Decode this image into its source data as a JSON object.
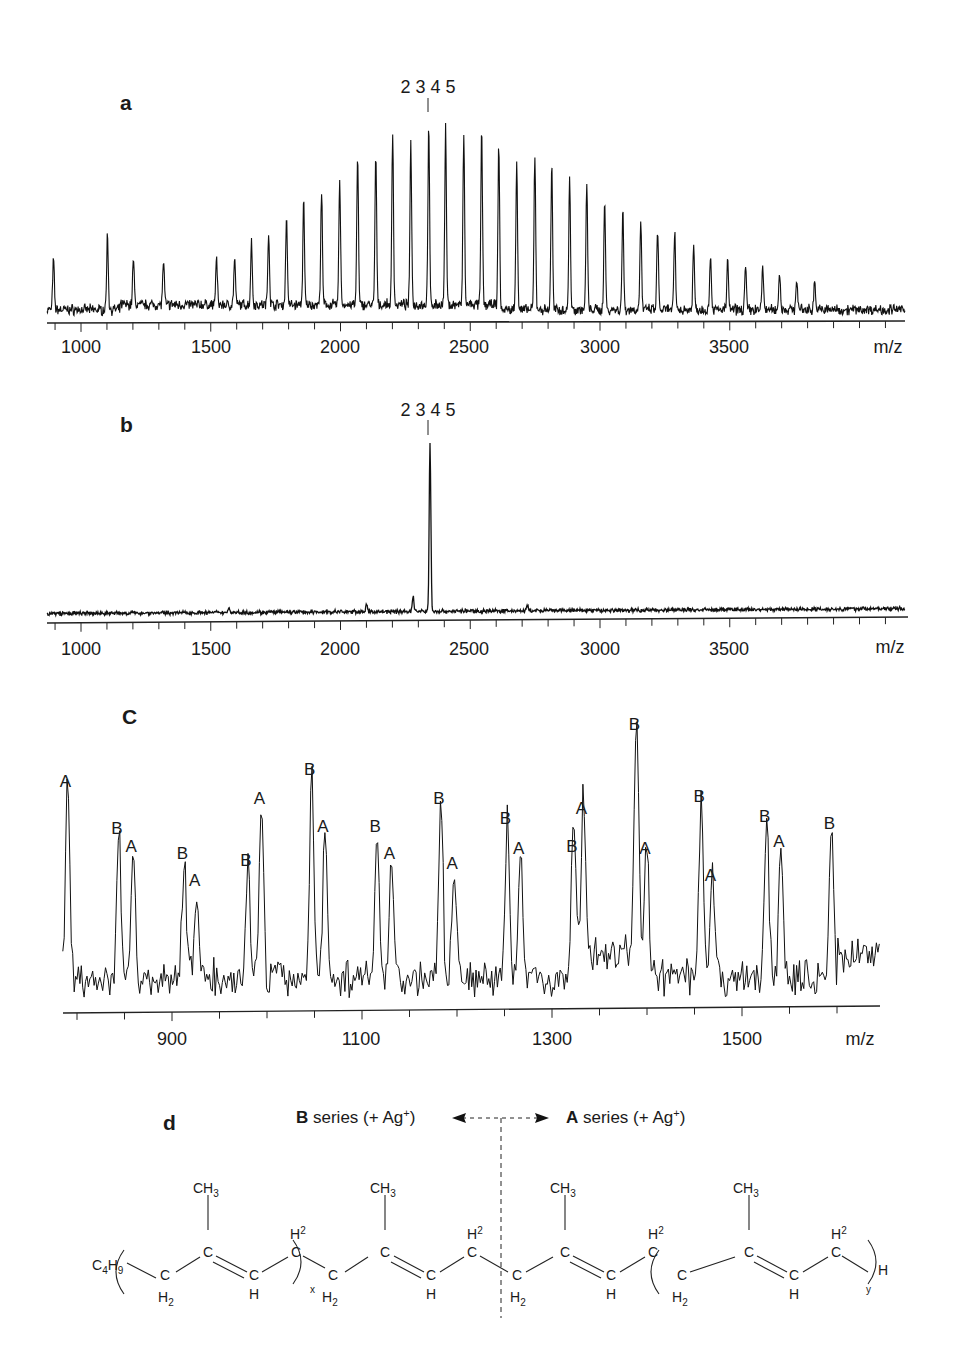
{
  "chart_data": [
    {
      "panel": "a",
      "type": "line",
      "title": "a",
      "xlabel": "m/z",
      "ylabel": "",
      "xlim": [
        869,
        4176
      ],
      "x_ticks": [
        1000,
        1500,
        2000,
        2500,
        3000,
        3500
      ],
      "x_tick_labels": [
        "1000",
        "1500",
        "2000",
        "2500",
        "3000",
        "3500"
      ],
      "minor_tick_step": 100,
      "grid": false,
      "annotation": {
        "text": "2 3 4 5",
        "x": 2345,
        "marker": "|"
      },
      "peaks": {
        "x": [
          894,
          1102,
          1202,
          1318,
          1522,
          1592,
          1657,
          1723,
          1792,
          1858,
          1927,
          1997,
          2066,
          2136,
          2201,
          2271,
          2340,
          2405,
          2475,
          2544,
          2610,
          2679,
          2749,
          2814,
          2883,
          2949,
          3018,
          3088,
          3157,
          3222,
          3288,
          3361,
          3426,
          3492,
          3561,
          3627,
          3692,
          3758,
          3827
        ],
        "intensity": [
          25,
          38,
          23,
          22,
          24,
          23,
          32,
          37,
          45,
          52,
          57,
          64,
          75,
          76,
          86,
          83,
          90,
          89,
          85,
          88,
          83,
          77,
          77,
          74,
          65,
          63,
          55,
          50,
          45,
          40,
          39,
          32,
          28,
          25,
          22,
          22,
          19,
          16,
          15
        ]
      }
    },
    {
      "panel": "b",
      "type": "line",
      "title": "b",
      "xlabel": "m/z",
      "ylabel": "",
      "xlim": [
        869,
        4176
      ],
      "x_ticks": [
        1000,
        1500,
        2000,
        2500,
        3000,
        3500
      ],
      "x_tick_labels": [
        "1000",
        "1500",
        "2000",
        "2500",
        "3000",
        "3500"
      ],
      "minor_tick_step": 100,
      "grid": false,
      "annotation": {
        "text": "2 3 4 5",
        "x": 2345,
        "marker": "|"
      },
      "peaks": {
        "x": [
          1570,
          2100,
          2280,
          2345,
          2720
        ],
        "intensity": [
          3,
          4,
          9,
          100,
          3
        ]
      }
    },
    {
      "panel": "c",
      "type": "line",
      "title": "C",
      "xlabel": "m/z",
      "ylabel": "",
      "xlim": [
        785,
        1645
      ],
      "x_ticks": [
        900,
        1100,
        1300,
        1500
      ],
      "x_tick_labels": [
        "900",
        "1100",
        "1300",
        "1500"
      ],
      "minor_tick_step": 50,
      "grid": false,
      "peaks": {
        "series": [
          "A",
          "B",
          "A",
          "B",
          "A",
          "B",
          "A",
          "B",
          "A",
          "B",
          "A",
          "B",
          "A",
          "B",
          "A",
          "B",
          "A",
          "B",
          "A",
          "B",
          "A",
          "B",
          "A",
          "B"
        ],
        "x": [
          790,
          844,
          859,
          913,
          926,
          980,
          994,
          1047,
          1061,
          1116,
          1131,
          1183,
          1197,
          1253,
          1267,
          1323,
          1333,
          1389,
          1400,
          1457,
          1469,
          1526,
          1541,
          1594
        ],
        "intensity": [
          77,
          58,
          51,
          48,
          37,
          45,
          70,
          82,
          59,
          59,
          48,
          70,
          44,
          62,
          50,
          51,
          66,
          100,
          50,
          71,
          39,
          63,
          53,
          60
        ]
      }
    }
  ],
  "panels": {
    "a": {
      "letter": "a",
      "annotation": "2 3 4 5",
      "xunit": "m/z",
      "ticks": [
        "1000",
        "1500",
        "2000",
        "2500",
        "3000",
        "3500"
      ]
    },
    "b": {
      "letter": "b",
      "annotation": "2 3 4 5",
      "xunit": "m/z",
      "ticks": [
        "1000",
        "1500",
        "2000",
        "2500",
        "3000",
        "3500"
      ]
    },
    "c": {
      "letter": "C",
      "xunit": "m/z",
      "ticks": [
        "900",
        "1100",
        "1300",
        "1500"
      ]
    },
    "d": {
      "letter": "d",
      "b_series": {
        "bold": "B",
        "rest": " series (+ Ag",
        "sup": "+",
        "close": ")"
      },
      "a_series": {
        "bold": "A",
        "rest": " series (+ Ag",
        "sup": "+",
        "close": ")"
      },
      "structure": {
        "end_group_left": "C4H9",
        "end_group_right": "H",
        "methyl": "CH3",
        "repeat_left_subscript": "x",
        "repeat_right_subscript": "y"
      }
    }
  }
}
